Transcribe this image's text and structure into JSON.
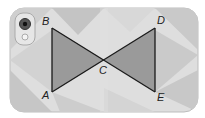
{
  "figure": {
    "type": "phone-case geometry diagram",
    "points": {
      "B": {
        "label": "B",
        "x": 52,
        "y": 28
      },
      "D": {
        "label": "D",
        "x": 155,
        "y": 28
      },
      "A": {
        "label": "A",
        "x": 52,
        "y": 92
      },
      "E": {
        "label": "E",
        "x": 155,
        "y": 92
      },
      "C": {
        "label": "C",
        "x": 104,
        "y": 60
      }
    },
    "segments": [
      "AB",
      "BE",
      "DE",
      "DA"
    ],
    "triangles": [
      "ABC",
      "DEC"
    ],
    "colors": {
      "case_base": "#dcdcdc",
      "triangle_fill": "#9a9a9a",
      "line": "#1a1a1a"
    }
  }
}
